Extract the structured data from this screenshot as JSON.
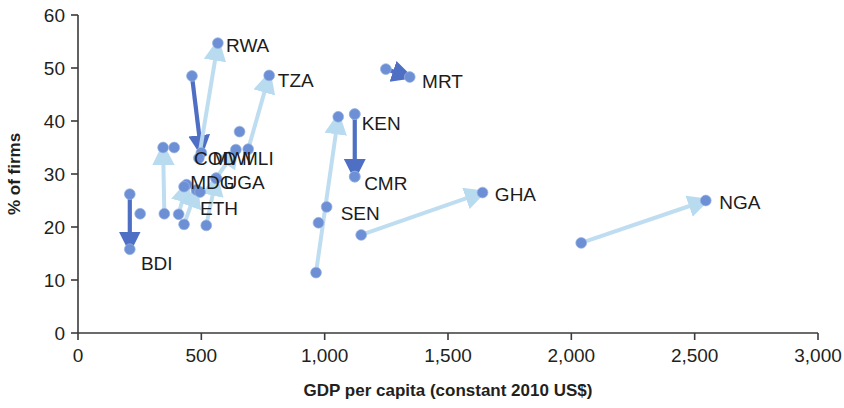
{
  "chart": {
    "type": "scatter",
    "title": "",
    "xlabel": "GDP per capita (constant 2010 US$)",
    "ylabel": "% of firms",
    "xlim": [
      0,
      3000
    ],
    "ylim": [
      0,
      60
    ],
    "xticks": [
      "0",
      "500",
      "1,000",
      "1,500",
      "2,000",
      "2,500",
      "3,000"
    ],
    "xtick_values": [
      0,
      500,
      1000,
      1500,
      2000,
      2500,
      3000
    ],
    "yticks": [
      "0",
      "10",
      "20",
      "30",
      "40",
      "50",
      "60"
    ],
    "ytick_values": [
      0,
      10,
      20,
      30,
      40,
      50,
      60
    ],
    "grid": false,
    "legend": "none",
    "marker_color": "#6c8fd6",
    "arrow_color_dark": "#4f6fc4",
    "arrow_color_light": "#bcdcf0"
  },
  "chart_data": {
    "type": "scatter",
    "title": "",
    "xlabel": "GDP per capita (constant 2010 US$)",
    "ylabel": "% of firms",
    "xlim": [
      0,
      3000
    ],
    "ylim": [
      0,
      60
    ],
    "xticks": [
      0,
      500,
      1000,
      1500,
      2000,
      2500,
      3000
    ],
    "yticks": [
      0,
      10,
      20,
      30,
      40,
      50,
      60
    ],
    "grid": false,
    "note": "Each country is an arrow from an earlier survey point to a later survey point. x = GDP per capita, y = % of firms.",
    "series": [
      {
        "name": "BDI",
        "label": "BDI",
        "start": {
          "x": 210,
          "y": 26.2
        },
        "end": {
          "x": 210,
          "y": 15.8
        },
        "arrow": "dark",
        "label_pos": {
          "x": 255,
          "y": 13.0
        }
      },
      {
        "name": "COD",
        "label": "COD",
        "start": {
          "x": 462,
          "y": 48.5
        },
        "end": {
          "x": 500,
          "y": 34.0
        },
        "arrow": "dark",
        "label_pos": {
          "x": 470,
          "y": 32.8
        }
      },
      {
        "name": "MDG",
        "label": "MDG",
        "start": {
          "x": 408,
          "y": 22.4
        },
        "end": {
          "x": 440,
          "y": 28.0
        },
        "arrow": "light",
        "label_pos": {
          "x": 455,
          "y": 28.3
        }
      },
      {
        "name": "ETH",
        "label": "ETH",
        "start": {
          "x": 430,
          "y": 20.5
        },
        "end": {
          "x": 480,
          "y": 27.0
        },
        "arrow": "light",
        "label_pos": {
          "x": 495,
          "y": 23.4
        }
      },
      {
        "name": "MWI",
        "label": "MWI",
        "start": {
          "x": 350,
          "y": 22.5
        },
        "end": {
          "x": 345,
          "y": 35.0
        },
        "arrow": "light",
        "label_pos": {
          "x": 545,
          "y": 32.8
        }
      },
      {
        "name": "UGA",
        "label": "UGA",
        "start": {
          "x": 520,
          "y": 20.3
        },
        "end": {
          "x": 560,
          "y": 29.2
        },
        "arrow": "light",
        "label_pos": {
          "x": 590,
          "y": 28.3
        }
      },
      {
        "name": "MLI",
        "label": "MLI",
        "start": {
          "x": 560,
          "y": 29.2
        },
        "end": {
          "x": 640,
          "y": 34.6
        },
        "arrow": "light",
        "label_pos": {
          "x": 665,
          "y": 32.8
        }
      },
      {
        "name": "RWA",
        "label": "RWA",
        "start": {
          "x": 490,
          "y": 33.0
        },
        "end": {
          "x": 567,
          "y": 54.7
        },
        "arrow": "light",
        "label_pos": {
          "x": 600,
          "y": 54.2
        }
      },
      {
        "name": "TZA",
        "label": "TZA",
        "start": {
          "x": 690,
          "y": 34.7
        },
        "end": {
          "x": 775,
          "y": 48.6
        },
        "arrow": "light",
        "label_pos": {
          "x": 810,
          "y": 47.5
        }
      },
      {
        "name": "KEN",
        "label": "KEN",
        "start": {
          "x": 1122,
          "y": 41.3
        },
        "end": {
          "x": 1122,
          "y": 29.5
        },
        "arrow": "dark",
        "label_pos": {
          "x": 1150,
          "y": 39.5
        }
      },
      {
        "name": "CMR",
        "label": "CMR",
        "start": {
          "x": 1122,
          "y": 41.3
        },
        "end": {
          "x": 1122,
          "y": 29.5
        },
        "arrow": "none",
        "label_pos": {
          "x": 1160,
          "y": 28.2
        }
      },
      {
        "name": "SEN",
        "label": "SEN",
        "start": {
          "x": 965,
          "y": 11.4
        },
        "end": {
          "x": 1055,
          "y": 40.8
        },
        "arrow": "light",
        "label_pos": {
          "x": 1065,
          "y": 22.5
        }
      },
      {
        "name": "GHA",
        "label": "GHA",
        "start": {
          "x": 1148,
          "y": 18.5
        },
        "end": {
          "x": 1640,
          "y": 26.5
        },
        "arrow": "light",
        "label_pos": {
          "x": 1690,
          "y": 26.1
        }
      },
      {
        "name": "NGA",
        "label": "NGA",
        "start": {
          "x": 2040,
          "y": 17.0
        },
        "end": {
          "x": 2545,
          "y": 25.0
        },
        "arrow": "light",
        "label_pos": {
          "x": 2600,
          "y": 24.6
        }
      },
      {
        "name": "MRT",
        "label": "MRT",
        "start": {
          "x": 1248,
          "y": 49.8
        },
        "end": {
          "x": 1345,
          "y": 48.3
        },
        "arrow": "dark",
        "label_pos": {
          "x": 1395,
          "y": 47.3
        }
      }
    ],
    "extra_points": [
      {
        "x": 252,
        "y": 22.5
      },
      {
        "x": 390,
        "y": 35.0
      },
      {
        "x": 430,
        "y": 27.6
      },
      {
        "x": 495,
        "y": 26.6
      },
      {
        "x": 1008,
        "y": 23.8
      },
      {
        "x": 975,
        "y": 20.8
      },
      {
        "x": 655,
        "y": 38.0
      }
    ]
  }
}
